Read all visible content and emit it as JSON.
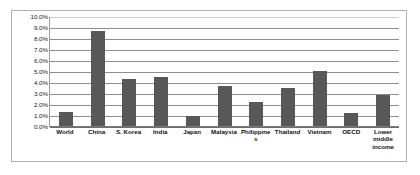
{
  "chart_data": {
    "type": "bar",
    "title": "",
    "subtitle": "",
    "xlabel": "",
    "ylabel": "",
    "ylim": [
      0,
      10
    ],
    "ytick_labels": [
      "10.0%",
      "9.0%",
      "8.0%",
      "7.0%",
      "6.0%",
      "5.0%",
      "4.0%",
      "3.0%",
      "2.0%",
      "1.0%",
      "0.0%"
    ],
    "ytick_values": [
      10,
      9,
      8,
      7,
      6,
      5,
      4,
      3,
      2,
      1,
      0
    ],
    "grid": true,
    "legend": false,
    "legend_position": "none",
    "value_unit": "percent",
    "bar_color": "#585858",
    "gridline_color": "#8f8f8f",
    "border_color": "#b0b0b0",
    "categories": [
      "World",
      "China",
      "S. Korea",
      "India",
      "Japan",
      "Malaysia",
      "Philippines",
      "Thailand",
      "Vietnam",
      "OECD",
      "Lower middle income"
    ],
    "values": [
      1.3,
      8.6,
      4.3,
      4.5,
      0.9,
      3.6,
      2.2,
      3.5,
      5.0,
      1.2,
      2.8
    ]
  }
}
